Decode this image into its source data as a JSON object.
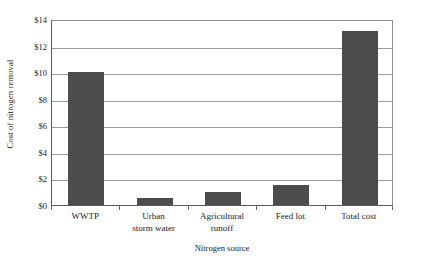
{
  "chart_data": {
    "type": "bar",
    "title": "",
    "xlabel": "Nitrogen source",
    "ylabel": "Cost of nitrogen removal",
    "categories": [
      "WWTP",
      "Urban storm water",
      "Agricultural runoff",
      "Feed lot",
      "Total cost"
    ],
    "category_lines": [
      [
        "WWTP"
      ],
      [
        "Urban",
        "storm water"
      ],
      [
        "Agricultural",
        "runoff"
      ],
      [
        "Feed lot"
      ],
      [
        "Total cost"
      ]
    ],
    "values": [
      10.0,
      0.5,
      1.0,
      1.5,
      13.1
    ],
    "ylim": [
      0,
      14
    ],
    "ytick_values": [
      0,
      2,
      4,
      6,
      8,
      10,
      12,
      14
    ],
    "ytick_labels": [
      "$0",
      "$2",
      "$4",
      "$6",
      "$8",
      "$10",
      "$12",
      "$14"
    ],
    "grid": true,
    "grid_axis": "y",
    "legend": false,
    "legend_position": "none",
    "bar_color": "#4c4c4c",
    "gridline_color": "#9a9a9a",
    "axis_color": "#5a5a5a",
    "background_color": "#ffffff"
  }
}
